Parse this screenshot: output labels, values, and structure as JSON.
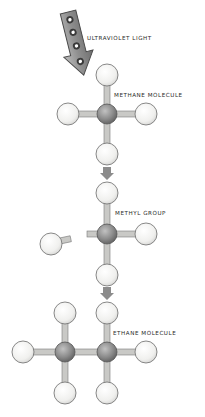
{
  "labels": {
    "uv": "ULTRAVIOLET LIGHT",
    "methane": "METHANE MOLECULE",
    "methyl": "METHYL GROUP",
    "ethane": "ETHANE MOLECULE"
  },
  "colors": {
    "hydrogen_fill": "#f4f4f2",
    "hydrogen_stroke": "#6b6b6b",
    "carbon_fill": "#878787",
    "carbon_highlight": "#b8b8b8",
    "bond_fill": "#c9c9c6",
    "bond_stroke": "#7a7a7a",
    "arrow_fill": "#8c8c8c",
    "uv_arrow_fill": "#9a9a9a",
    "uv_arrow_stroke": "#4a4a4a",
    "text": "#2a2a2a"
  }
}
